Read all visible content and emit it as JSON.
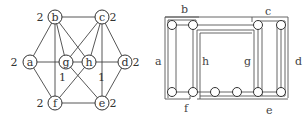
{
  "left_graph": {
    "nodes": [
      {
        "id": "a",
        "label": "a",
        "weight": "2",
        "x": 30,
        "y": 62,
        "wx": 14,
        "wy": 66
      },
      {
        "id": "b",
        "label": "b",
        "weight": "2",
        "x": 55,
        "y": 17,
        "wx": 40,
        "wy": 21
      },
      {
        "id": "c",
        "label": "c",
        "weight": "2",
        "x": 102,
        "y": 17,
        "wx": 113,
        "wy": 21
      },
      {
        "id": "d",
        "label": "d",
        "weight": "2",
        "x": 125,
        "y": 62,
        "wx": 136,
        "wy": 66
      },
      {
        "id": "e",
        "label": "e",
        "weight": "2",
        "x": 102,
        "y": 103,
        "wx": 113,
        "wy": 107
      },
      {
        "id": "f",
        "label": "f",
        "weight": "2",
        "x": 55,
        "y": 103,
        "wx": 40,
        "wy": 107
      },
      {
        "id": "g",
        "label": "g",
        "weight": "",
        "x": 66,
        "y": 62,
        "wx": 0,
        "wy": 0
      },
      {
        "id": "h",
        "label": "h",
        "weight": "",
        "x": 89,
        "y": 62,
        "wx": 0,
        "wy": 0
      }
    ],
    "edges": [
      [
        "a",
        "b"
      ],
      [
        "a",
        "f"
      ],
      [
        "a",
        "g"
      ],
      [
        "g",
        "h"
      ],
      [
        "h",
        "d"
      ],
      [
        "b",
        "c"
      ],
      [
        "b",
        "g"
      ],
      [
        "b",
        "h"
      ],
      [
        "b",
        "f"
      ],
      [
        "c",
        "g"
      ],
      [
        "c",
        "h"
      ],
      [
        "c",
        "d"
      ],
      [
        "c",
        "e"
      ],
      [
        "d",
        "e"
      ],
      [
        "f",
        "e"
      ],
      [
        "f",
        "h"
      ],
      [
        "g",
        "e"
      ]
    ],
    "edge_labels": [
      {
        "text": "1",
        "x": 59,
        "y": 81
      },
      {
        "text": "1",
        "x": 98,
        "y": 81
      }
    ]
  },
  "right_diagram": {
    "top_nodes": [
      {
        "x": 172,
        "y": 25
      },
      {
        "x": 193,
        "y": 25
      },
      {
        "x": 258,
        "y": 25
      },
      {
        "x": 281,
        "y": 25
      }
    ],
    "bottom_nodes": [
      {
        "x": 172,
        "y": 92
      },
      {
        "x": 193,
        "y": 92
      },
      {
        "x": 215,
        "y": 92
      },
      {
        "x": 237,
        "y": 92
      },
      {
        "x": 258,
        "y": 92
      },
      {
        "x": 281,
        "y": 92
      }
    ],
    "labels": [
      {
        "text": "b",
        "x": 181,
        "y": 13
      },
      {
        "text": "c",
        "x": 265,
        "y": 15
      },
      {
        "text": "a",
        "x": 155,
        "y": 65
      },
      {
        "text": "h",
        "x": 202,
        "y": 65
      },
      {
        "text": "g",
        "x": 244,
        "y": 65
      },
      {
        "text": "d",
        "x": 295,
        "y": 65
      },
      {
        "text": "f",
        "x": 184,
        "y": 112
      },
      {
        "text": "e",
        "x": 266,
        "y": 114
      }
    ]
  }
}
